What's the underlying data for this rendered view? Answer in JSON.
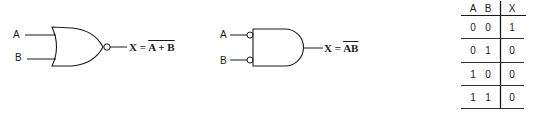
{
  "nor_gate": {
    "input_a_label": "A",
    "input_b_label": "B",
    "output_lhs": "X =",
    "output_rhs_overlined": "A + B"
  },
  "and_gate_inverted_inputs": {
    "input_a_label": "A",
    "input_b_label": "B",
    "output_lhs": "X =",
    "output_rhs_terms": [
      "A",
      "B"
    ],
    "output_rhs_overlined_each": true
  },
  "truth_table": {
    "headers": [
      "A",
      "B",
      "X"
    ],
    "rows": [
      [
        "0",
        "0",
        "1"
      ],
      [
        "0",
        "1",
        "0"
      ],
      [
        "1",
        "0",
        "0"
      ],
      [
        "1",
        "1",
        "0"
      ]
    ]
  },
  "colors": {
    "ink": "#1a1a1a",
    "background": "#ffffff"
  }
}
